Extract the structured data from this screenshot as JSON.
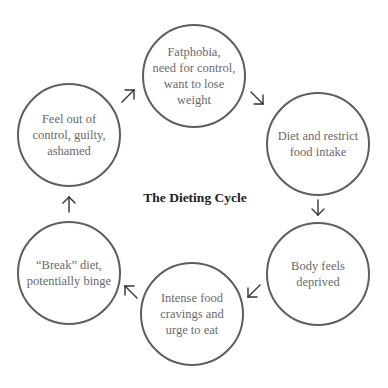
{
  "diagram": {
    "title": "The Dieting Cycle",
    "colors": {
      "circle_stroke": "#5e5e5e",
      "node_text": "#6a6a6a",
      "title_text": "#222222",
      "arrow": "#333333",
      "background": "#ffffff"
    },
    "nodes": [
      {
        "id": "fatphobia",
        "label": "Fatphobia,\nneed for control,\nwant to lose\nweight"
      },
      {
        "id": "diet",
        "label": "Diet and restrict\nfood intake"
      },
      {
        "id": "deprived",
        "label": "Body feels\ndeprived"
      },
      {
        "id": "cravings",
        "label": "Intense food\ncravings and\nurge to eat"
      },
      {
        "id": "break",
        "label": "“Break” diet,\npotentially binge"
      },
      {
        "id": "guilt",
        "label": "Feel out of\ncontrol, guilty,\nashamed"
      }
    ],
    "edges": [
      {
        "from": "fatphobia",
        "to": "diet",
        "icon": "arrow-down-right-icon"
      },
      {
        "from": "diet",
        "to": "deprived",
        "icon": "arrow-down-icon"
      },
      {
        "from": "deprived",
        "to": "cravings",
        "icon": "arrow-down-left-icon"
      },
      {
        "from": "cravings",
        "to": "break",
        "icon": "arrow-up-left-icon"
      },
      {
        "from": "break",
        "to": "guilt",
        "icon": "arrow-up-icon"
      },
      {
        "from": "guilt",
        "to": "fatphobia",
        "icon": "arrow-up-right-icon"
      }
    ]
  }
}
